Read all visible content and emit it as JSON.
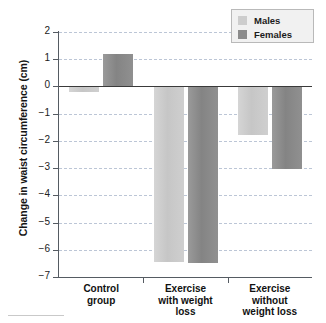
{
  "chart_data": {
    "type": "bar",
    "title": "",
    "xlabel": "",
    "ylabel": "Change in waist circumference (cm)",
    "ylim": [
      -7,
      2
    ],
    "ytick_step": 1,
    "yticks": [
      2,
      1,
      0,
      -1,
      -2,
      -3,
      -4,
      -5,
      -6,
      -7
    ],
    "ytick_labels": [
      "2",
      "1",
      "0",
      "−1",
      "−2",
      "−3",
      "−4",
      "−5",
      "−6",
      "−7"
    ],
    "grid": "horizontal-dashed",
    "zero_line": true,
    "legend_position": "top-right",
    "categories": [
      "Control group",
      "Exercise with weight loss",
      "Exercise without weight loss"
    ],
    "category_lines": [
      [
        "Control",
        "group"
      ],
      [
        "Exercise",
        "with weight",
        "loss"
      ],
      [
        "Exercise",
        "without",
        "weight loss"
      ]
    ],
    "series": [
      {
        "name": "Males",
        "color": "#cdcdcd",
        "values": [
          -0.2,
          -6.45,
          -1.8
        ]
      },
      {
        "name": "Females",
        "color": "#8b8b8b",
        "values": [
          1.2,
          -6.5,
          -3.05
        ]
      }
    ]
  },
  "legend": {
    "entries": [
      {
        "label": "Males"
      },
      {
        "label": "Females"
      }
    ]
  }
}
